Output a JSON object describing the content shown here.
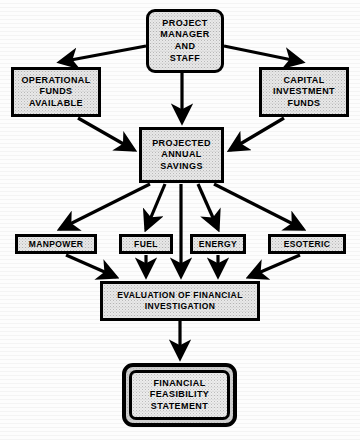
{
  "diagram": {
    "type": "flowchart",
    "colors": {
      "background": "#fdfdfd",
      "node_fill": "#e9e9e9",
      "node_border": "#000000",
      "edge": "#000000",
      "text": "#000000"
    },
    "nodes": [
      {
        "id": "project-manager",
        "shape": "rounded-rectangle",
        "lines": [
          "PROJECT",
          "MANAGER",
          "AND",
          "STAFF"
        ]
      },
      {
        "id": "operational-funds",
        "shape": "rectangle",
        "lines": [
          "OPERATIONAL",
          "FUNDS",
          "AVAILABLE"
        ]
      },
      {
        "id": "capital-investment",
        "shape": "rectangle",
        "lines": [
          "CAPITAL",
          "INVESTMENT",
          "FUNDS"
        ]
      },
      {
        "id": "projected-annual-savings",
        "shape": "rectangle",
        "lines": [
          "PROJECTED",
          "ANNUAL",
          "SAVINGS"
        ]
      },
      {
        "id": "manpower",
        "shape": "rectangle",
        "lines": [
          "MANPOWER"
        ]
      },
      {
        "id": "fuel",
        "shape": "rectangle",
        "lines": [
          "FUEL"
        ]
      },
      {
        "id": "energy",
        "shape": "rectangle",
        "lines": [
          "ENERGY"
        ]
      },
      {
        "id": "esoteric",
        "shape": "rectangle",
        "lines": [
          "ESOTERIC"
        ]
      },
      {
        "id": "evaluation",
        "shape": "rectangle",
        "lines": [
          "EVALUATION  OF FINANCIAL",
          "INVESTIGATION"
        ]
      },
      {
        "id": "financial-feasibility-statement",
        "shape": "double-rounded-rectangle",
        "lines": [
          "FINANCIAL",
          "FEASIBILITY",
          "STATEMENT"
        ]
      }
    ],
    "edges": [
      {
        "from": "project-manager",
        "to": "operational-funds",
        "style": "arrow"
      },
      {
        "from": "project-manager",
        "to": "capital-investment",
        "style": "arrow"
      },
      {
        "from": "project-manager",
        "to": "projected-annual-savings",
        "style": "arrow"
      },
      {
        "from": "operational-funds",
        "to": "projected-annual-savings",
        "style": "arrow"
      },
      {
        "from": "capital-investment",
        "to": "projected-annual-savings",
        "style": "arrow"
      },
      {
        "from": "projected-annual-savings",
        "to": "manpower",
        "style": "arrow"
      },
      {
        "from": "projected-annual-savings",
        "to": "fuel",
        "style": "arrow"
      },
      {
        "from": "projected-annual-savings",
        "to": "energy",
        "style": "arrow"
      },
      {
        "from": "projected-annual-savings",
        "to": "esoteric",
        "style": "arrow"
      },
      {
        "from": "projected-annual-savings",
        "to": "evaluation",
        "style": "arrow"
      },
      {
        "from": "manpower",
        "to": "evaluation",
        "style": "arrow"
      },
      {
        "from": "fuel",
        "to": "evaluation",
        "style": "arrow"
      },
      {
        "from": "energy",
        "to": "evaluation",
        "style": "arrow"
      },
      {
        "from": "esoteric",
        "to": "evaluation",
        "style": "arrow"
      },
      {
        "from": "evaluation",
        "to": "financial-feasibility-statement",
        "style": "arrow"
      }
    ]
  },
  "nodes": {
    "project_manager": {
      "l1": "PROJECT",
      "l2": "MANAGER",
      "l3": "AND",
      "l4": "STAFF"
    },
    "operational_funds": {
      "l1": "OPERATIONAL",
      "l2": "FUNDS",
      "l3": "AVAILABLE"
    },
    "capital_investment": {
      "l1": "CAPITAL",
      "l2": "INVESTMENT",
      "l3": "FUNDS"
    },
    "projected_savings": {
      "l1": "PROJECTED",
      "l2": "ANNUAL",
      "l3": "SAVINGS"
    },
    "manpower": {
      "l1": "MANPOWER"
    },
    "fuel": {
      "l1": "FUEL"
    },
    "energy": {
      "l1": "ENERGY"
    },
    "esoteric": {
      "l1": "ESOTERIC"
    },
    "evaluation": {
      "l1": "EVALUATION  OF FINANCIAL",
      "l2": "INVESTIGATION"
    },
    "statement": {
      "l1": "FINANCIAL",
      "l2": "FEASIBILITY",
      "l3": "STATEMENT"
    }
  }
}
